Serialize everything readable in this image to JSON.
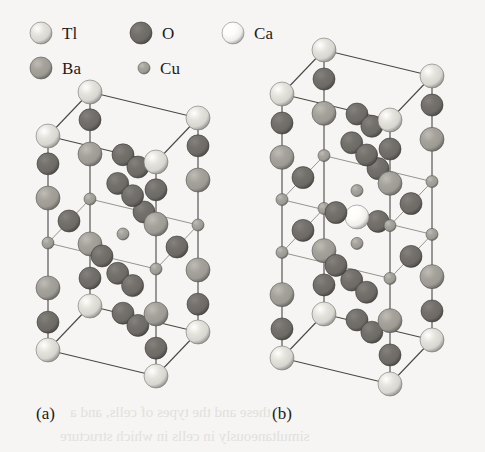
{
  "figure": {
    "background_color": "#f6f5f3",
    "caption_a": "(a)",
    "caption_b": "(b)"
  },
  "legend": {
    "items": [
      {
        "symbol": "Tl",
        "element": "thallium",
        "color": "#d8d6d0",
        "radius": 11,
        "icon": "sphere-icon",
        "x": 30,
        "y": 22
      },
      {
        "symbol": "O",
        "element": "oxygen",
        "color": "#6d6a66",
        "radius": 11,
        "icon": "sphere-icon",
        "x": 130,
        "y": 22
      },
      {
        "symbol": "Ca",
        "element": "calcium",
        "color": "#efeeeb",
        "radius": 11,
        "icon": "sphere-icon",
        "x": 222,
        "y": 22
      },
      {
        "symbol": "Ba",
        "element": "barium",
        "color": "#9d9a94",
        "radius": 11,
        "icon": "sphere-icon",
        "x": 30,
        "y": 57
      },
      {
        "symbol": "Cu",
        "element": "copper",
        "color": "#9d9a94",
        "radius": 6,
        "icon": "sphere-icon",
        "x": 138,
        "y": 57
      }
    ]
  },
  "structures": [
    {
      "id": "a",
      "name": "tl-2201-unit-cell",
      "label": "(a)",
      "label_x": 36,
      "label_y": 404,
      "cell": {
        "origin_x": 48,
        "origin_y": 350,
        "vec_a_x": 108,
        "vec_a_y": 26,
        "vec_b_x": 42,
        "vec_b_y": -44,
        "vec_c_x": 0,
        "vec_c_y": -214
      },
      "layers": [
        {
          "z": 0.0,
          "species": "Tl",
          "note": "bottom-corner-layer"
        },
        {
          "z": 0.13,
          "species": "O",
          "note": "apical-oxygen"
        },
        {
          "z": 0.29,
          "species": "Ba",
          "note": "barium-layer"
        },
        {
          "z": 0.5,
          "species": "Cu",
          "note": "copper-oxide-plane"
        },
        {
          "z": 0.71,
          "species": "Ba",
          "note": "barium-layer"
        },
        {
          "z": 0.87,
          "species": "O",
          "note": "apical-oxygen"
        },
        {
          "z": 1.0,
          "species": "Tl",
          "note": "top-corner-layer"
        }
      ],
      "cuo2_plane_count": 1
    },
    {
      "id": "b",
      "name": "tl-2212-unit-cell",
      "label": "(b)",
      "label_x": 272,
      "label_y": 404,
      "cell": {
        "origin_x": 282,
        "origin_y": 358,
        "vec_a_x": 108,
        "vec_a_y": 26,
        "vec_b_x": 42,
        "vec_b_y": -44,
        "vec_c_x": 0,
        "vec_c_y": -264
      },
      "layers": [
        {
          "z": 0.0,
          "species": "Tl",
          "note": "bottom-corner-layer"
        },
        {
          "z": 0.11,
          "species": "O",
          "note": "apical-oxygen"
        },
        {
          "z": 0.24,
          "species": "Ba",
          "note": "barium-layer"
        },
        {
          "z": 0.4,
          "species": "Cu",
          "note": "copper-oxide-plane"
        },
        {
          "z": 0.5,
          "species": "Ca",
          "note": "calcium-layer"
        },
        {
          "z": 0.6,
          "species": "Cu",
          "note": "copper-oxide-plane"
        },
        {
          "z": 0.76,
          "species": "Ba",
          "note": "barium-layer"
        },
        {
          "z": 0.89,
          "species": "O",
          "note": "apical-oxygen"
        },
        {
          "z": 1.0,
          "species": "Tl",
          "note": "top-corner-layer"
        }
      ],
      "cuo2_plane_count": 2
    }
  ],
  "palette": {
    "Tl": "#d8d6d0",
    "Ba": "#9d9a94",
    "Ca": "#efeeeb",
    "Cu": "#9d9a94",
    "O": "#6d6a66",
    "bond": "#4a4845"
  },
  "radii": {
    "Tl": 12,
    "Ba": 12,
    "Ca": 12,
    "Cu": 6,
    "O": 11
  },
  "bleed_text": [
    {
      "text": "these and the types of cells, and a",
      "x": 70,
      "y": 404
    },
    {
      "text": "simultaneously in cells in which structure",
      "x": 60,
      "y": 428
    }
  ]
}
